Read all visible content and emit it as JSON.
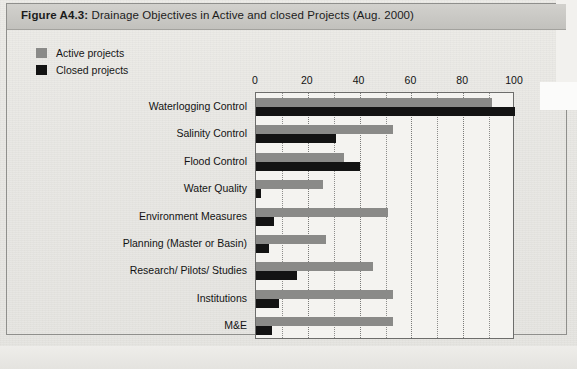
{
  "figure": {
    "label": "Figure A4.3:",
    "caption": "Drainage Objectives in Active and closed Projects (Aug. 2000)"
  },
  "legend": {
    "position": "top-left",
    "items": [
      {
        "label": "Active projects",
        "color": "#8a8a88"
      },
      {
        "label": "Closed projects",
        "color": "#131313"
      }
    ]
  },
  "chart_data": {
    "type": "bar",
    "orientation": "horizontal",
    "title": "Drainage Objectives in Active and closed Projects (Aug. 2000)",
    "xlabel": "",
    "ylabel": "",
    "xlim": [
      0,
      100
    ],
    "xticks": [
      0,
      20,
      40,
      60,
      80,
      100
    ],
    "xtick_labels": [
      "0",
      "20",
      "40",
      "60",
      "80",
      "100"
    ],
    "grid": "vertical-dotted-every-10",
    "legend_position": "top-left",
    "categories": [
      "Waterlogging Control",
      "Salinity Control",
      "Flood Control",
      "Water Quality",
      "Environment Measures",
      "Planning (Master or Basin)",
      "Research/ Pilots/ Studies",
      "Institutions",
      "M&E"
    ],
    "series": [
      {
        "name": "Active projects",
        "color": "#8a8a88",
        "values": [
          91,
          53,
          34,
          26,
          51,
          27,
          45,
          53,
          53
        ]
      },
      {
        "name": "Closed projects",
        "color": "#131313",
        "values": [
          100,
          31,
          40,
          2,
          7,
          5,
          16,
          9,
          6
        ]
      }
    ]
  }
}
